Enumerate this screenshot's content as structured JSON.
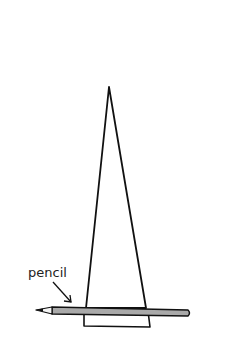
{
  "diagram": {
    "labels": {
      "pencil": "pencil"
    },
    "colors": {
      "line": "#111111",
      "pencil_body": "#a9a9a9",
      "pencil_tip_wood": "#f4f4f4",
      "background": "#ffffff"
    }
  }
}
